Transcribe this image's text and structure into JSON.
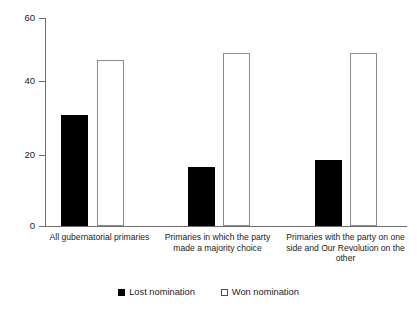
{
  "chart_data": {
    "type": "bar",
    "title": "",
    "subtitle": "",
    "xlabel": "",
    "ylabel": "",
    "ylim": [
      0,
      60
    ],
    "yticks": [
      0,
      20,
      40,
      60
    ],
    "ytick_labels": [
      "0",
      "20",
      "40",
      "60"
    ],
    "grid": false,
    "legend_position": "bottom-center",
    "categories": [
      "All gubernatorial primaries",
      "Primaries in which the party made a majority choice",
      "Primaries with the party on one side and Our Revolution on the other"
    ],
    "series": [
      {
        "name": "Lost nomination",
        "color": "#000000",
        "fill": "solid",
        "values": [
          32,
          17,
          19
        ]
      },
      {
        "name": "Won nomination",
        "color": "#ffffff",
        "fill": "open",
        "values": [
          48,
          50,
          50
        ]
      }
    ]
  },
  "legend": {
    "items": [
      {
        "label": "Lost nomination",
        "marker": "filled-square-marker"
      },
      {
        "label": "Won nomination",
        "marker": "open-square-marker"
      }
    ]
  },
  "axis": {
    "y_tick_labels": [
      "60",
      "40",
      "20",
      "0"
    ]
  },
  "categories_display": [
    "All gubernatorial primaries",
    "Primaries in which the\nparty made a majority\nchoice",
    "Primaries with the party\non one side and Our\nRevolution on the other"
  ]
}
